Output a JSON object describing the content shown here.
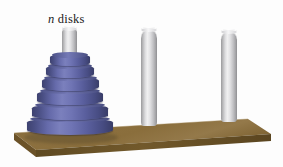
{
  "figure": {
    "label": {
      "variable": "n",
      "text": " disks"
    },
    "background_color": "#fdfdfd"
  },
  "base": {
    "name": "wooden-base",
    "top_color": "#8a6e3c",
    "front_color": "#6d5529",
    "left_color": "#7a5f31",
    "edge_color": "#5c4722",
    "top_left": [
      14,
      133
    ],
    "top_right": [
      248,
      119
    ],
    "bottom_right": [
      271,
      134
    ],
    "bottom_left": [
      36,
      150
    ],
    "thickness": 9
  },
  "pegs": [
    {
      "id": "peg-a",
      "name": "peg-left",
      "x": 62,
      "top": 28,
      "height": 30,
      "width": 15,
      "occupied": true,
      "disk_count": 6
    },
    {
      "id": "peg-b",
      "name": "peg-middle",
      "x": 141,
      "top": 29,
      "height": 97,
      "width": 16,
      "occupied": false,
      "disk_count": 0
    },
    {
      "id": "peg-c",
      "name": "peg-right",
      "x": 221,
      "top": 31,
      "height": 91,
      "width": 16,
      "occupied": false,
      "disk_count": 0
    }
  ],
  "disks": {
    "color": "#5a5f9e",
    "count": 6,
    "stack": [
      {
        "index": 1,
        "name": "disk-1",
        "x": 50,
        "y": 54,
        "width": 40,
        "height": 12
      },
      {
        "index": 2,
        "name": "disk-2",
        "x": 46,
        "y": 65,
        "width": 48,
        "height": 13
      },
      {
        "index": 3,
        "name": "disk-3",
        "x": 42,
        "y": 77,
        "width": 57,
        "height": 14
      },
      {
        "index": 4,
        "name": "disk-4",
        "x": 37,
        "y": 90,
        "width": 66,
        "height": 15
      },
      {
        "index": 5,
        "name": "disk-5",
        "x": 32,
        "y": 104,
        "width": 76,
        "height": 16
      },
      {
        "index": 6,
        "name": "disk-6",
        "x": 27,
        "y": 118,
        "width": 86,
        "height": 17
      }
    ]
  },
  "shadow": {
    "x": 24,
    "y": 131,
    "width": 94,
    "height": 13
  }
}
